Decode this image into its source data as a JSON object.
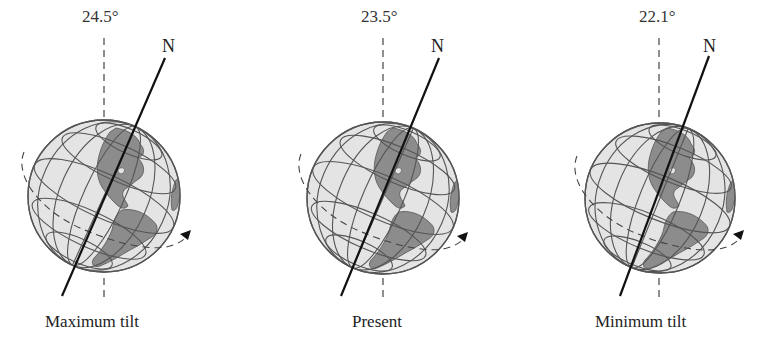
{
  "figure": {
    "panels": [
      {
        "id": "maximum",
        "angle_label": "24.5°",
        "north_label": "N",
        "caption": "Maximum tilt",
        "tilt_degrees": 24.5
      },
      {
        "id": "present",
        "angle_label": "23.5°",
        "north_label": "N",
        "caption": "Present",
        "tilt_degrees": 23.5
      },
      {
        "id": "minimum",
        "angle_label": "22.1°",
        "north_label": "N",
        "caption": "Minimum tilt",
        "tilt_degrees": 22.1
      }
    ],
    "colors": {
      "globe_fill": "#e4e4e4",
      "land_fill": "#8c8c8c",
      "grid_line": "#555555",
      "axis_line": "#111111",
      "dashed_line": "#444444"
    }
  }
}
